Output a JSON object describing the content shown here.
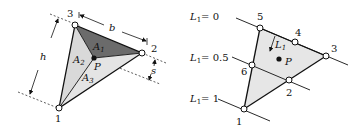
{
  "left_diagram": {
    "nodes": [
      {
        "id": "1",
        "label": "1"
      },
      {
        "id": "2",
        "label": "2"
      },
      {
        "id": "3",
        "label": "3"
      }
    ],
    "point": {
      "label": "P"
    },
    "areas": [
      {
        "label": "A",
        "sub": "1",
        "shade": "#6b6b6b"
      },
      {
        "label": "A",
        "sub": "2",
        "shade": "#d9d9d9"
      },
      {
        "label": "A",
        "sub": "3",
        "shade": "#e4e4e4"
      }
    ],
    "dimensions": {
      "b": "b",
      "h": "h",
      "s": "s"
    }
  },
  "right_diagram": {
    "nodes": [
      {
        "id": "1",
        "label": "1"
      },
      {
        "id": "2",
        "label": "2"
      },
      {
        "id": "3",
        "label": "3"
      },
      {
        "id": "4",
        "label": "4"
      },
      {
        "id": "5",
        "label": "5"
      },
      {
        "id": "6",
        "label": "6"
      }
    ],
    "point": {
      "label": "P"
    },
    "arrow": {
      "label": "L",
      "sub": "1"
    },
    "level_lines": [
      {
        "label": "L",
        "sub": "1",
        "value": "= 0"
      },
      {
        "label": "L",
        "sub": "1",
        "value": "= 0.5"
      },
      {
        "label": "L",
        "sub": "1",
        "value": "= 1"
      }
    ],
    "fill": "#e6e6e6"
  }
}
